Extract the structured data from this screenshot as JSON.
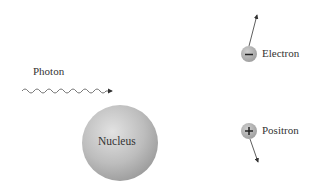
{
  "labels": {
    "photon": "Photon",
    "nucleus": "Nucleus",
    "electron": "Electron",
    "positron": "Positron"
  },
  "symbols": {
    "electron_charge": "−",
    "positron_charge": "+"
  },
  "colors": {
    "particle_fill": "#a8a8a8",
    "nucleus_fill": "#b5b5b5",
    "line": "#555555",
    "text": "#333333"
  }
}
